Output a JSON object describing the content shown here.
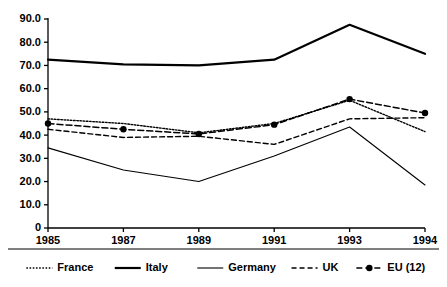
{
  "chart_data": {
    "type": "line",
    "title": "",
    "subtitle": "",
    "xlabel": "",
    "ylabel": "",
    "categories": [
      "1985",
      "1987",
      "1989",
      "1991",
      "1993",
      "1994"
    ],
    "x": [
      1985,
      1987,
      1989,
      1991,
      1993,
      1994
    ],
    "ylim": [
      0,
      90
    ],
    "ytick_labels": [
      "0",
      "10.0",
      "20.0",
      "30.0",
      "40.0",
      "50.0",
      "60.0",
      "70.0",
      "80.0",
      "90.0"
    ],
    "ytick_values": [
      0,
      10,
      20,
      30,
      40,
      50,
      60,
      70,
      80,
      90
    ],
    "grid": false,
    "legend_position": "bottom",
    "series": [
      {
        "name": "France",
        "style": "dotted",
        "markers": false,
        "color": "#000000",
        "values": [
          47.0,
          45.0,
          41.0,
          45.0,
          55.0,
          41.5
        ]
      },
      {
        "name": "Italy",
        "style": "solid-thick",
        "markers": false,
        "color": "#000000",
        "values": [
          72.5,
          70.5,
          70.0,
          72.5,
          87.5,
          75.0
        ]
      },
      {
        "name": "Germany",
        "style": "solid-thin",
        "markers": false,
        "color": "#000000",
        "values": [
          34.5,
          25.0,
          20.0,
          31.0,
          43.5,
          18.5
        ]
      },
      {
        "name": "UK",
        "style": "dashed",
        "markers": false,
        "color": "#000000",
        "values": [
          42.5,
          39.0,
          39.5,
          36.0,
          47.0,
          47.5
        ]
      },
      {
        "name": "EU (12)",
        "style": "dash-dot",
        "markers": true,
        "color": "#000000",
        "values": [
          45.0,
          42.5,
          40.5,
          44.5,
          55.5,
          49.5
        ]
      }
    ],
    "legend": [
      {
        "label": "France",
        "style": "dotted",
        "markers": false
      },
      {
        "label": "Italy",
        "style": "solid-thick",
        "markers": false
      },
      {
        "label": "Germany",
        "style": "solid-thin",
        "markers": false
      },
      {
        "label": "UK",
        "style": "dashed",
        "markers": false
      },
      {
        "label": "EU (12)",
        "style": "dash-dot",
        "markers": true
      }
    ]
  }
}
